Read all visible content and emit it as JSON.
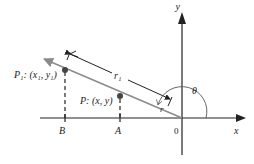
{
  "diagram": {
    "type": "polar-coordinates-ray",
    "axes": {
      "x_label": "x",
      "y_label": "y",
      "origin_label": "0"
    },
    "points": [
      {
        "id": "P1",
        "label": "P₁: (x₁, y₁)",
        "foot_label": "B"
      },
      {
        "id": "P",
        "label": "P: (x, y)",
        "foot_label": "A"
      }
    ],
    "distances": {
      "r1_label": "r₁",
      "r_label": "r"
    },
    "angle_label": "θ",
    "colors": {
      "axis": "#222222",
      "ray": "#8a8a8a",
      "dimension": "#222222",
      "point": "#444444"
    }
  }
}
